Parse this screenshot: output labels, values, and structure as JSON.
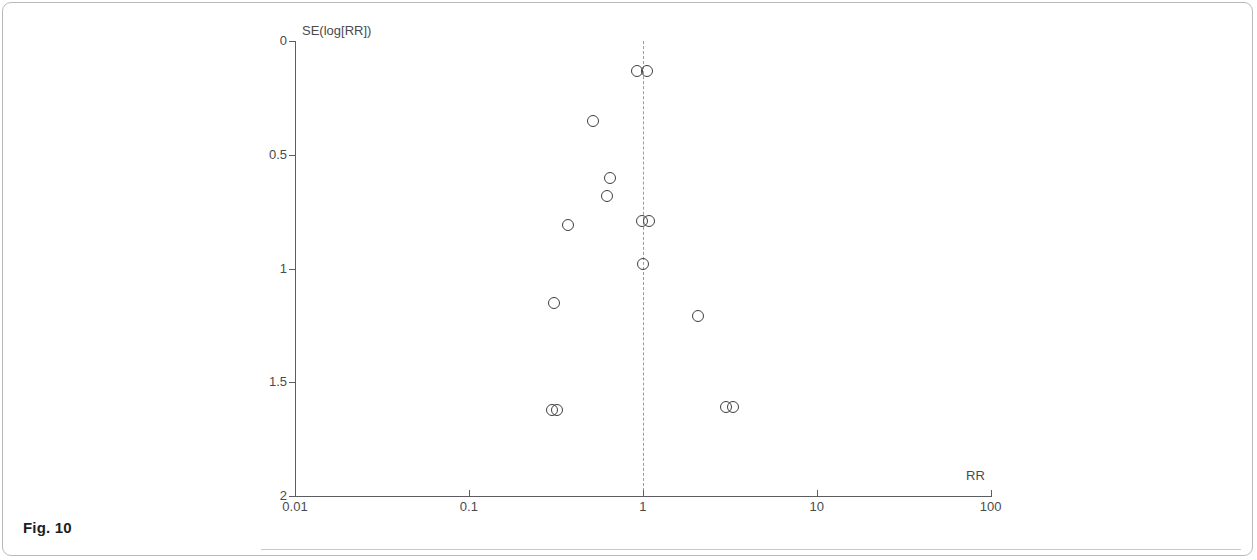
{
  "figure": {
    "caption": "Fig. 10"
  },
  "chart_data": {
    "type": "scatter",
    "subtype": "funnel-plot",
    "title": "",
    "xlabel": "RR",
    "ylabel": "SE(log[RR])",
    "x_scale": "log",
    "y_scale": "linear",
    "y_inverted": true,
    "xlim": [
      0.01,
      100
    ],
    "ylim": [
      0,
      2
    ],
    "grid": false,
    "legend": null,
    "x_ticks": [
      {
        "value": 0.01,
        "label": "0.01"
      },
      {
        "value": 0.1,
        "label": "0.1"
      },
      {
        "value": 1,
        "label": "1"
      },
      {
        "value": 10,
        "label": "10"
      },
      {
        "value": 100,
        "label": "100"
      }
    ],
    "y_ticks": [
      {
        "value": 0,
        "label": "0"
      },
      {
        "value": 0.5,
        "label": "0.5"
      },
      {
        "value": 1,
        "label": "1"
      },
      {
        "value": 1.5,
        "label": "1.5"
      },
      {
        "value": 2,
        "label": "2"
      }
    ],
    "reference_line": {
      "orientation": "vertical",
      "value": 1,
      "style": "dashed",
      "color": "#9b9b9f"
    },
    "marker": {
      "shape": "circle",
      "filled": false,
      "edge_color": "#3f3f43",
      "size": 12
    },
    "points": [
      {
        "rr": 0.93,
        "se": 0.13
      },
      {
        "rr": 1.06,
        "se": 0.13
      },
      {
        "rr": 0.52,
        "se": 0.35
      },
      {
        "rr": 0.65,
        "se": 0.6
      },
      {
        "rr": 0.62,
        "se": 0.68
      },
      {
        "rr": 0.37,
        "se": 0.81
      },
      {
        "rr": 0.99,
        "se": 0.79
      },
      {
        "rr": 1.08,
        "se": 0.79
      },
      {
        "rr": 1.0,
        "se": 0.98
      },
      {
        "rr": 0.31,
        "se": 1.15
      },
      {
        "rr": 2.08,
        "se": 1.21
      },
      {
        "rr": 0.3,
        "se": 1.62
      },
      {
        "rr": 0.32,
        "se": 1.62
      },
      {
        "rr": 3.0,
        "se": 1.61
      },
      {
        "rr": 3.3,
        "se": 1.61
      }
    ]
  }
}
